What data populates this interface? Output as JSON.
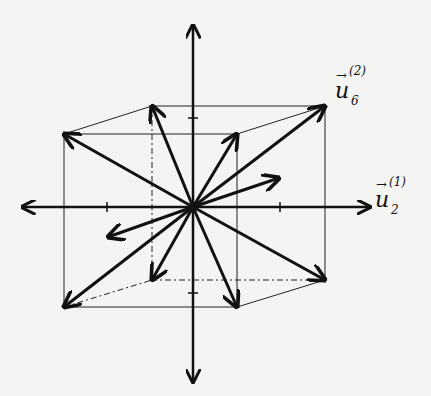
{
  "diagram": {
    "type": "cube-vectors",
    "center": [
      193,
      207
    ],
    "axes": {
      "x": {
        "from": [
          22,
          207
        ],
        "to": [
          370,
          207
        ],
        "ticks": [
          107,
          280
        ]
      },
      "y": {
        "from": [
          193,
          382
        ],
        "to": [
          193,
          25
        ],
        "ticks": [
          118,
          293
        ]
      }
    },
    "front_square": [
      [
        64,
        134
      ],
      [
        237,
        134
      ],
      [
        237,
        307
      ],
      [
        64,
        307
      ]
    ],
    "back_square": [
      [
        152,
        106
      ],
      [
        325,
        106
      ],
      [
        325,
        280
      ],
      [
        152,
        280
      ]
    ],
    "vectors_to_vertices": [
      [
        64,
        134
      ],
      [
        237,
        134
      ],
      [
        237,
        307
      ],
      [
        64,
        307
      ],
      [
        152,
        106
      ],
      [
        325,
        106
      ],
      [
        325,
        280
      ],
      [
        152,
        280
      ]
    ],
    "short_vectors": [
      [
        279,
        178
      ],
      [
        108,
        237
      ]
    ],
    "labels": [
      {
        "id": "u6",
        "base": "u",
        "sub": "6",
        "sup": "(2)",
        "arrow": "→",
        "pos": [
          335,
          72
        ]
      },
      {
        "id": "u2",
        "base": "u",
        "sub": "2",
        "sup": "(1)",
        "arrow": "→",
        "pos": [
          375,
          183
        ]
      }
    ]
  }
}
